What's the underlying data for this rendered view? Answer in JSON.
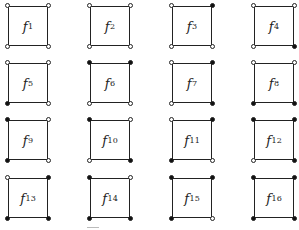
{
  "diagram": {
    "layout": {
      "columns": 4,
      "rows": 4,
      "col_x": [
        8,
        90,
        172,
        254
      ],
      "row_y": [
        6,
        63,
        120,
        178
      ]
    },
    "legend": {
      "filled": "black vertex",
      "open": "white vertex"
    },
    "squares": [
      {
        "label": "f",
        "index": "1",
        "corners": {
          "tl": false,
          "tr": false,
          "bl": false,
          "br": false
        }
      },
      {
        "label": "f",
        "index": "2",
        "corners": {
          "tl": false,
          "tr": false,
          "bl": false,
          "br": false
        }
      },
      {
        "label": "f",
        "index": "3",
        "corners": {
          "tl": false,
          "tr": true,
          "bl": false,
          "br": false
        }
      },
      {
        "label": "f",
        "index": "4",
        "corners": {
          "tl": false,
          "tr": false,
          "bl": false,
          "br": true
        }
      },
      {
        "label": "f",
        "index": "5",
        "corners": {
          "tl": false,
          "tr": false,
          "bl": true,
          "br": false
        }
      },
      {
        "label": "f",
        "index": "6",
        "corners": {
          "tl": true,
          "tr": true,
          "bl": false,
          "br": false
        }
      },
      {
        "label": "f",
        "index": "7",
        "corners": {
          "tl": false,
          "tr": true,
          "bl": false,
          "br": true
        }
      },
      {
        "label": "f",
        "index": "8",
        "corners": {
          "tl": false,
          "tr": false,
          "bl": true,
          "br": true
        }
      },
      {
        "label": "f",
        "index": "9",
        "corners": {
          "tl": true,
          "tr": false,
          "bl": true,
          "br": false
        }
      },
      {
        "label": "f",
        "index": "10",
        "corners": {
          "tl": true,
          "tr": false,
          "bl": false,
          "br": true
        }
      },
      {
        "label": "f",
        "index": "11",
        "corners": {
          "tl": false,
          "tr": true,
          "bl": true,
          "br": false
        }
      },
      {
        "label": "f",
        "index": "12",
        "corners": {
          "tl": true,
          "tr": true,
          "bl": false,
          "br": true
        }
      },
      {
        "label": "f",
        "index": "13",
        "corners": {
          "tl": false,
          "tr": true,
          "bl": true,
          "br": true
        }
      },
      {
        "label": "f",
        "index": "14",
        "corners": {
          "tl": true,
          "tr": false,
          "bl": true,
          "br": true
        }
      },
      {
        "label": "f",
        "index": "15",
        "corners": {
          "tl": true,
          "tr": true,
          "bl": true,
          "br": false
        }
      },
      {
        "label": "f",
        "index": "16",
        "corners": {
          "tl": true,
          "tr": true,
          "bl": true,
          "br": true
        }
      }
    ]
  }
}
